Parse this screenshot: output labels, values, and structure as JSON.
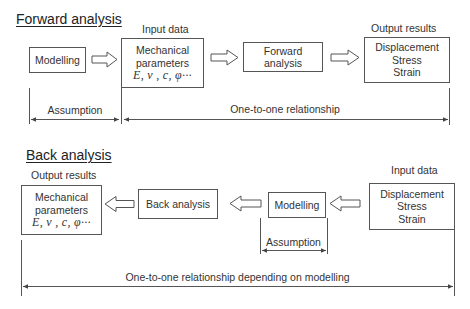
{
  "forward": {
    "title": "Forward analysis",
    "input_label": "Input data",
    "output_label": "Output results",
    "boxes": {
      "modelling": "Modelling",
      "mechanical": {
        "line1": "Mechanical",
        "line2": "parameters",
        "symbols": "E, ν , c, φ···"
      },
      "forward_analysis": "Forward analysis",
      "results": {
        "line1": "Displacement",
        "line2": "Stress",
        "line3": "Strain"
      }
    },
    "dimensions": {
      "assumption": "Assumption",
      "relationship": "One-to-one relationship"
    }
  },
  "back": {
    "title": "Back analysis",
    "output_label": "Output results",
    "input_label": "Input data",
    "boxes": {
      "mechanical": {
        "line1": "Mechanical",
        "line2": "parameters",
        "symbols": "E, ν , c, φ···"
      },
      "back_analysis": "Back analysis",
      "modelling": "Modelling",
      "data": {
        "line1": "Displacement",
        "line2": "Stress",
        "line3": "Strain"
      }
    },
    "dimensions": {
      "assumption": "Assumption",
      "relationship": "One-to-one relationship depending on modelling"
    }
  },
  "colors": {
    "line": "#555555",
    "text": "#333333",
    "background": "#ffffff"
  }
}
